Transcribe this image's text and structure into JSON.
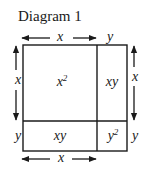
{
  "title": "Diagram 1",
  "colors": {
    "ink": "#1a1a1a",
    "background": "#ffffff"
  },
  "dimensions": {
    "top": {
      "x_label": "x",
      "y_label": "y"
    },
    "bottom": {
      "x_label": "x"
    },
    "left": {
      "x_label": "x",
      "y_label": "y"
    },
    "right": {
      "x_label": "x",
      "y_label": "y"
    }
  },
  "regions": {
    "top_left": {
      "base": "x",
      "exp": "2"
    },
    "top_right": {
      "text": "xy"
    },
    "bottom_left": {
      "text": "xy"
    },
    "bottom_right": {
      "base": "y",
      "exp": "2"
    }
  }
}
